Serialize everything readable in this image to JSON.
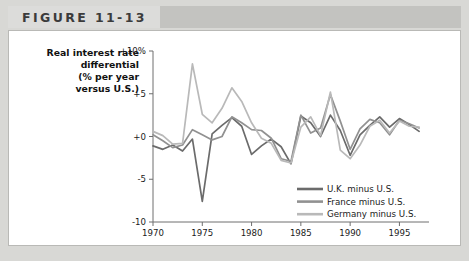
{
  "header": {
    "figure_label": "FIGURE 11-13"
  },
  "chart_data": {
    "type": "line",
    "title": "",
    "ylabel_lines": [
      "Real interest rate",
      "differential",
      "(% per year",
      "versus U.S.)"
    ],
    "xlabel": "",
    "xlim": [
      1970,
      1998
    ],
    "ylim": [
      -10,
      10
    ],
    "yticks": [
      10,
      5,
      0,
      -5,
      -10
    ],
    "ytick_labels": [
      "+10%",
      "+5",
      "+0",
      "-5",
      "-10"
    ],
    "xticks": [
      1970,
      1975,
      1980,
      1985,
      1990,
      1995
    ],
    "xtick_labels": [
      "1970",
      "1975",
      "1980",
      "1985",
      "1990",
      "1995"
    ],
    "grid": false,
    "legend_position": "inside-bottom-right",
    "colors": {
      "uk": "#6b6b6b",
      "france": "#919191",
      "germany": "#b9b9b9"
    },
    "x": [
      1970,
      1971,
      1972,
      1973,
      1974,
      1975,
      1976,
      1977,
      1978,
      1979,
      1980,
      1981,
      1982,
      1983,
      1984,
      1985,
      1986,
      1987,
      1988,
      1989,
      1990,
      1991,
      1992,
      1993,
      1994,
      1995,
      1996,
      1997
    ],
    "series": [
      {
        "name": "U.K. minus U.S.",
        "color_key": "uk",
        "values": [
          -1.1,
          -1.5,
          -1.0,
          -1.7,
          -0.3,
          -7.6,
          0.3,
          1.3,
          2.2,
          1.2,
          -2.1,
          -1.1,
          -0.3,
          -1.2,
          -3.2,
          2.4,
          1.6,
          0.0,
          2.5,
          0.7,
          -2.2,
          0.2,
          1.3,
          2.3,
          1.1,
          2.1,
          1.4,
          0.6
        ]
      },
      {
        "name": "France minus U.S.",
        "color_key": "france",
        "values": [
          0.2,
          -0.5,
          -1.3,
          -1.0,
          0.8,
          0.2,
          -0.4,
          0.0,
          2.3,
          1.6,
          0.8,
          0.7,
          -0.2,
          -2.6,
          -2.9,
          2.5,
          0.4,
          1.0,
          4.9,
          1.8,
          -1.5,
          0.9,
          2.0,
          1.6,
          0.2,
          1.9,
          1.5,
          1.0
        ]
      },
      {
        "name": "Germany minus U.S.",
        "color_key": "germany",
        "values": [
          0.6,
          0.1,
          -0.9,
          -0.8,
          8.5,
          2.6,
          1.6,
          3.3,
          5.7,
          4.1,
          1.6,
          -0.2,
          -0.8,
          -2.8,
          -3.1,
          1.1,
          2.3,
          0.1,
          5.2,
          -1.6,
          -2.6,
          -1.0,
          1.2,
          1.9,
          0.4,
          1.8,
          1.2,
          1.1
        ]
      }
    ]
  }
}
